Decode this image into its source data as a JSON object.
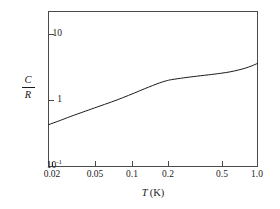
{
  "figure": {
    "background_color": "#ffffff",
    "line_color": "#1a1a1a",
    "axis_color": "#4a4a4a"
  },
  "axes": {
    "x": {
      "title_variable": "T",
      "title_unit": "(K)",
      "scale": "log",
      "min": 0.02,
      "max": 1.0,
      "tick_labels": [
        "0.02",
        "0.05",
        "0.1",
        "0.2",
        "0.5",
        "1.0"
      ],
      "tick_values": [
        0.02,
        0.05,
        0.1,
        0.2,
        0.5,
        1.0
      ]
    },
    "y": {
      "title_numerator": "C",
      "title_denominator": "R",
      "scale": "log",
      "min": 0.1,
      "max": 20,
      "tick_labels": [
        "10",
        "1",
        "10"
      ],
      "tick_label_bottom_exponent": "-1",
      "tick_values": [
        10,
        1,
        0.1
      ]
    }
  },
  "chart_data": {
    "type": "line",
    "title": "",
    "subtitle": "",
    "xlabel": "T (K)",
    "ylabel": "C/R",
    "xscale": "log",
    "yscale": "log",
    "xlim": [
      0.02,
      1.0
    ],
    "ylim": [
      0.1,
      20
    ],
    "grid": false,
    "legend": null,
    "xticks": [
      0.02,
      0.05,
      0.1,
      0.2,
      0.5,
      1.0
    ],
    "xticklabels": [
      "0.02",
      "0.05",
      "0.1",
      "0.2",
      "0.5",
      "1.0"
    ],
    "yticks": [
      0.1,
      1,
      10
    ],
    "yticklabels": [
      "10^-1",
      "1",
      "10"
    ],
    "annotations": [],
    "series": [
      {
        "name": "C/R",
        "x": [
          0.02,
          0.025,
          0.03,
          0.04,
          0.05,
          0.065,
          0.08,
          0.1,
          0.12,
          0.14,
          0.16,
          0.18,
          0.2,
          0.25,
          0.3,
          0.4,
          0.5,
          0.6,
          0.7,
          0.8,
          0.9,
          1.0
        ],
        "y": [
          0.43,
          0.5,
          0.57,
          0.69,
          0.8,
          0.95,
          1.1,
          1.3,
          1.5,
          1.68,
          1.85,
          1.98,
          2.07,
          2.2,
          2.3,
          2.45,
          2.58,
          2.72,
          2.9,
          3.1,
          3.35,
          3.65
        ]
      }
    ]
  }
}
